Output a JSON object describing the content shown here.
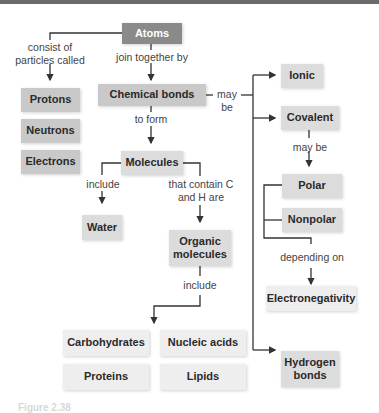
{
  "diagram": {
    "title_node": "Atoms",
    "nodes": {
      "atoms": "Atoms",
      "protons": "Protons",
      "neutrons": "Neutrons",
      "electrons": "Electrons",
      "chemical_bonds": "Chemical bonds",
      "molecules": "Molecules",
      "water": "Water",
      "organic_molecules": "Organic molecules",
      "carbohydrates": "Carbohydrates",
      "nucleic_acids": "Nucleic acids",
      "proteins": "Proteins",
      "lipids": "Lipids",
      "ionic": "Ionic",
      "covalent": "Covalent",
      "polar": "Polar",
      "nonpolar": "Nonpolar",
      "electronegativity": "Electronegativity",
      "hydrogen_bonds": "Hydrogen bonds"
    },
    "edge_labels": {
      "consist_of": "consist of particles called",
      "join_together_by": "join together by",
      "to_form": "to form",
      "may_be_bonds": "may be",
      "may_be_covalent": "may be",
      "include_water": "include",
      "that_contain": "that contain C and H are",
      "include_organic": "include",
      "depending_on": "depending on"
    },
    "caption": "Figure 2.38"
  }
}
